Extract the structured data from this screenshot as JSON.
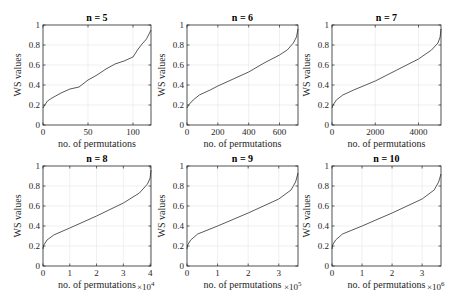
{
  "chart_data": [
    {
      "type": "line",
      "title": "n = 5",
      "xlabel": "no. of permutations",
      "ylabel": "WS values",
      "x_multiplier": "",
      "xlim": [
        0,
        120
      ],
      "ylim": [
        0,
        1
      ],
      "xticks": [
        0,
        50,
        100
      ],
      "xtick_labels": [
        "0",
        "50",
        "100"
      ],
      "yticks": [
        0,
        0.2,
        0.4,
        0.6,
        0.8,
        1
      ],
      "ytick_labels": [
        "0",
        "0.2",
        "0.4",
        "0.6",
        "0.8",
        "1"
      ],
      "grid": true,
      "series": [
        {
          "name": "WS",
          "x": [
            0,
            2,
            5,
            10,
            20,
            30,
            40,
            50,
            60,
            70,
            80,
            90,
            100,
            105,
            110,
            115,
            120
          ],
          "y": [
            0.17,
            0.2,
            0.24,
            0.27,
            0.32,
            0.36,
            0.38,
            0.45,
            0.5,
            0.56,
            0.61,
            0.64,
            0.68,
            0.75,
            0.81,
            0.86,
            0.95
          ]
        }
      ]
    },
    {
      "type": "line",
      "title": "n = 6",
      "xlabel": "no. of permutations",
      "ylabel": "WS values",
      "x_multiplier": "",
      "xlim": [
        0,
        720
      ],
      "ylim": [
        0,
        1
      ],
      "xticks": [
        0,
        200,
        400,
        600
      ],
      "xtick_labels": [
        "0",
        "200",
        "400",
        "600"
      ],
      "yticks": [
        0,
        0.2,
        0.4,
        0.6,
        0.8,
        1
      ],
      "ytick_labels": [
        "0",
        "0.2",
        "0.4",
        "0.6",
        "0.8",
        "1"
      ],
      "grid": true,
      "series": [
        {
          "name": "WS",
          "x": [
            0,
            10,
            40,
            80,
            150,
            200,
            300,
            400,
            500,
            600,
            650,
            690,
            710,
            720
          ],
          "y": [
            0.17,
            0.2,
            0.25,
            0.3,
            0.35,
            0.39,
            0.46,
            0.53,
            0.62,
            0.7,
            0.75,
            0.82,
            0.88,
            0.96
          ]
        }
      ]
    },
    {
      "type": "line",
      "title": "n = 7",
      "xlabel": "no. of permutations",
      "ylabel": "WS values",
      "x_multiplier": "",
      "xlim": [
        0,
        5040
      ],
      "ylim": [
        0,
        1
      ],
      "xticks": [
        0,
        2000,
        4000
      ],
      "xtick_labels": [
        "0",
        "2000",
        "4000"
      ],
      "yticks": [
        0,
        0.2,
        0.4,
        0.6,
        0.8,
        1
      ],
      "ytick_labels": [
        "0",
        "0.2",
        "0.4",
        "0.6",
        "0.8",
        "1"
      ],
      "grid": true,
      "series": [
        {
          "name": "WS",
          "x": [
            0,
            50,
            200,
            500,
            1000,
            2000,
            3000,
            4000,
            4600,
            4900,
            5000,
            5040
          ],
          "y": [
            0.17,
            0.2,
            0.25,
            0.3,
            0.35,
            0.44,
            0.55,
            0.66,
            0.75,
            0.82,
            0.88,
            0.96
          ]
        }
      ]
    },
    {
      "type": "line",
      "title": "n = 8",
      "xlabel": "no. of permutations",
      "ylabel": "WS values",
      "x_multiplier": "×10^4",
      "xlim": [
        0,
        4.032
      ],
      "ylim": [
        0,
        1
      ],
      "xticks": [
        0,
        1,
        2,
        3,
        4
      ],
      "xtick_labels": [
        "0",
        "1",
        "2",
        "3",
        "4"
      ],
      "yticks": [
        0,
        0.2,
        0.4,
        0.6,
        0.8,
        1
      ],
      "ytick_labels": [
        "0",
        "0.2",
        "0.4",
        "0.6",
        "0.8",
        "1"
      ],
      "grid": true,
      "series": [
        {
          "name": "WS",
          "x": [
            0,
            0.03,
            0.15,
            0.4,
            1.0,
            2.0,
            3.0,
            3.6,
            3.9,
            4.0,
            4.032
          ],
          "y": [
            0.17,
            0.21,
            0.26,
            0.31,
            0.38,
            0.5,
            0.63,
            0.73,
            0.82,
            0.88,
            0.96
          ]
        }
      ]
    },
    {
      "type": "line",
      "title": "n = 9",
      "xlabel": "no. of permutations",
      "ylabel": "WS values",
      "x_multiplier": "×10^5",
      "xlim": [
        0,
        3.6288
      ],
      "ylim": [
        0,
        1
      ],
      "xticks": [
        0,
        1,
        2,
        3
      ],
      "xtick_labels": [
        "0",
        "1",
        "2",
        "3"
      ],
      "yticks": [
        0,
        0.2,
        0.4,
        0.6,
        0.8,
        1
      ],
      "ytick_labels": [
        "0",
        "0.2",
        "0.4",
        "0.6",
        "0.8",
        "1"
      ],
      "grid": true,
      "series": [
        {
          "name": "WS",
          "x": [
            0,
            0.02,
            0.12,
            0.35,
            1.0,
            2.0,
            3.0,
            3.4,
            3.55,
            3.6288
          ],
          "y": [
            0.17,
            0.21,
            0.26,
            0.32,
            0.4,
            0.53,
            0.67,
            0.76,
            0.84,
            0.93
          ]
        }
      ]
    },
    {
      "type": "line",
      "title": "n = 10",
      "xlabel": "no. of permutations",
      "ylabel": "WS values",
      "x_multiplier": "×10^6",
      "xlim": [
        0,
        3.6288
      ],
      "ylim": [
        0,
        1
      ],
      "xticks": [
        0,
        1,
        2,
        3
      ],
      "xtick_labels": [
        "0",
        "1",
        "2",
        "3"
      ],
      "yticks": [
        0,
        0.2,
        0.4,
        0.6,
        0.8,
        1
      ],
      "ytick_labels": [
        "0",
        "0.2",
        "0.4",
        "0.6",
        "0.8",
        "1"
      ],
      "grid": true,
      "series": [
        {
          "name": "WS",
          "x": [
            0,
            0.02,
            0.12,
            0.35,
            1.0,
            2.0,
            3.0,
            3.4,
            3.55,
            3.6288
          ],
          "y": [
            0.17,
            0.21,
            0.26,
            0.32,
            0.4,
            0.53,
            0.67,
            0.76,
            0.84,
            0.92
          ]
        }
      ]
    }
  ],
  "colors": {
    "line": "#5a5a5a",
    "axis": "#262626",
    "grid": "#e6e6e6"
  }
}
